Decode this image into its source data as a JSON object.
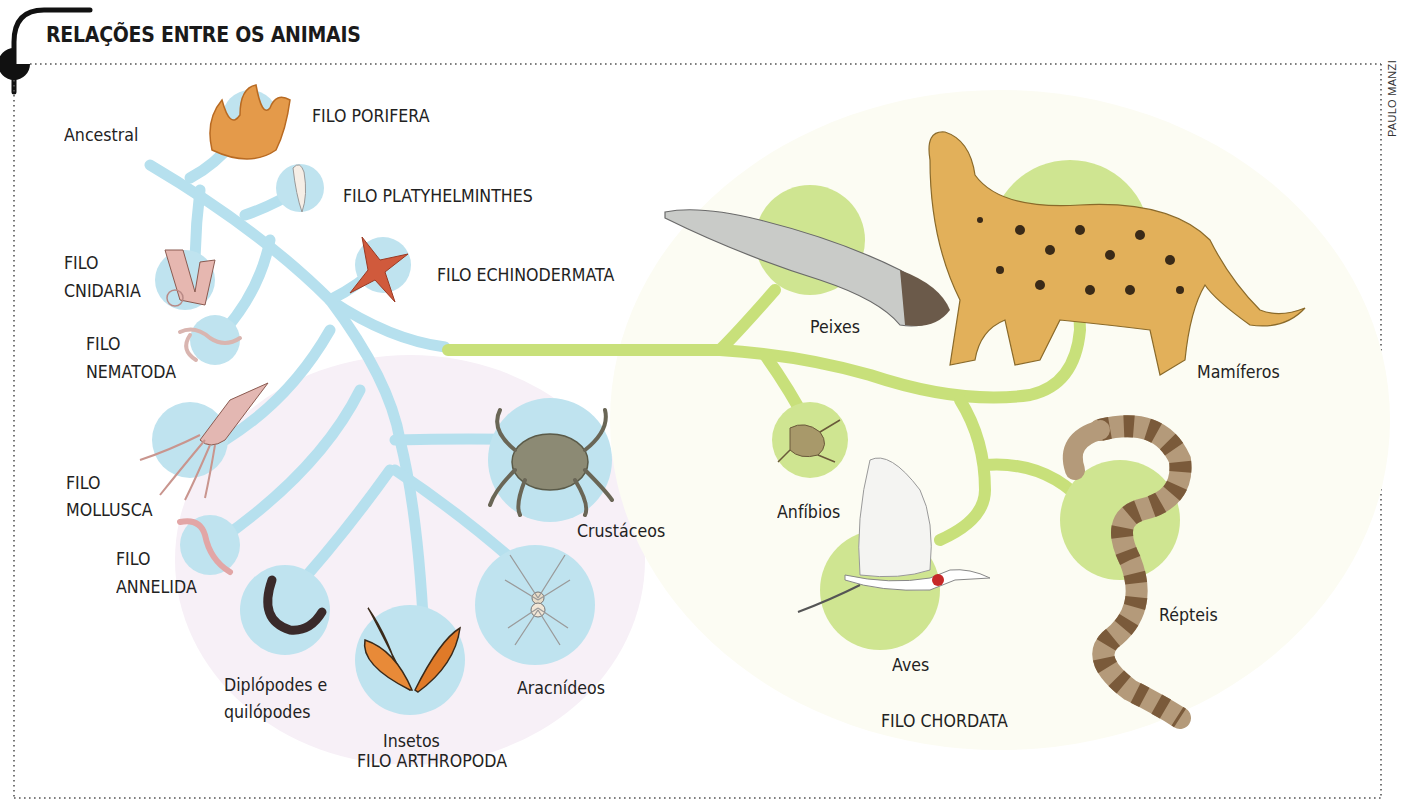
{
  "header": {
    "title": "RELAÇÕES ENTRE OS ANIMAIS",
    "credit": "PAULO MANZI"
  },
  "colors": {
    "invertebrate_branch": "#b6e0ee",
    "invertebrate_node": "#bfe3ef",
    "chordate_branch": "#c8e07a",
    "chordate_node": "#cfe591",
    "arthropod_bg": "#f6eef6",
    "chordate_bg": "#fbfbf0",
    "frame": "#555555",
    "text": "#222222"
  },
  "diagram": {
    "root_label": "Ancestral",
    "invertebrates": [
      {
        "id": "porifera",
        "label": "FILO PORIFERA",
        "icon": "sponge-icon"
      },
      {
        "id": "platyhelminthes",
        "label": "FILO PLATYHELMINTHES",
        "icon": "flatworm-icon"
      },
      {
        "id": "echinodermata",
        "label": "FILO ECHINODERMATA",
        "icon": "starfish-icon"
      },
      {
        "id": "cnidaria",
        "label_line1": "FILO",
        "label_line2": "CNIDARIA",
        "icon": "coral-polyp-icon"
      },
      {
        "id": "nematoda",
        "label_line1": "FILO",
        "label_line2": "NEMATODA",
        "icon": "roundworm-icon"
      },
      {
        "id": "mollusca",
        "label_line1": "FILO",
        "label_line2": "MOLLUSCA",
        "icon": "squid-icon"
      },
      {
        "id": "annelida",
        "label_line1": "FILO",
        "label_line2": "ANNELIDA",
        "icon": "earthworm-icon"
      }
    ],
    "arthropoda": {
      "phylum_label": "FILO ARTHROPODA",
      "groups": [
        {
          "id": "crustaceos",
          "label": "Crustáceos",
          "icon": "crab-icon"
        },
        {
          "id": "aracnideos",
          "label": "Aracnídeos",
          "icon": "spider-icon"
        },
        {
          "id": "insetos",
          "label": "Insetos",
          "icon": "butterfly-icon"
        },
        {
          "id": "diplopodes",
          "label_line1": "Diplópodes e",
          "label_line2": "quilópodes",
          "icon": "millipede-icon"
        }
      ]
    },
    "chordata": {
      "phylum_label": "FILO CHORDATA",
      "groups": [
        {
          "id": "peixes",
          "label": "Peixes",
          "icon": "fish-icon"
        },
        {
          "id": "mamiferos",
          "label": "Mamíferos",
          "icon": "jaguar-icon"
        },
        {
          "id": "anfibios",
          "label": "Anfíbios",
          "icon": "frog-icon"
        },
        {
          "id": "aves",
          "label": "Aves",
          "icon": "bird-icon"
        },
        {
          "id": "repteis",
          "label": "Répteis",
          "icon": "snake-icon"
        }
      ]
    }
  }
}
